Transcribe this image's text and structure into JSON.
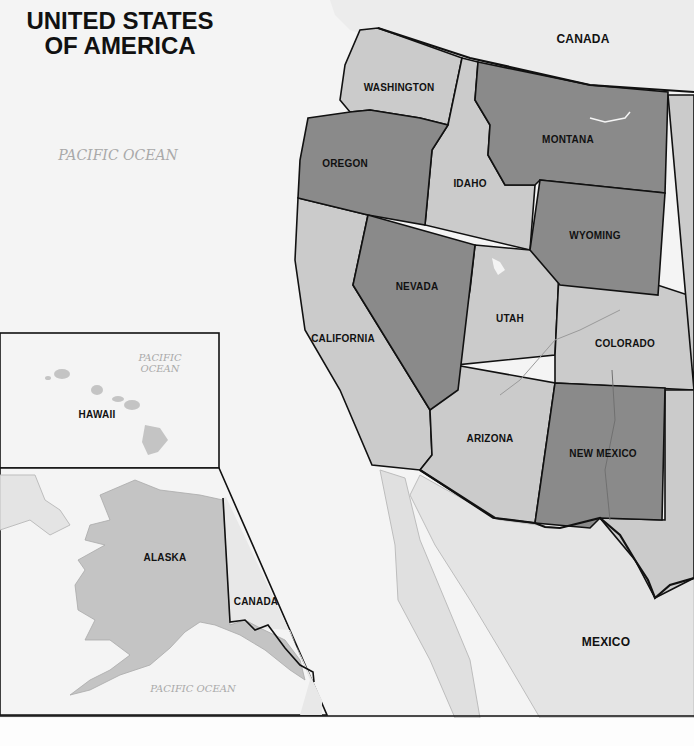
{
  "map": {
    "title_line1": "UNITED STATES",
    "title_line2": "OF AMERICA",
    "oceans": {
      "main": "PACIFIC OCEAN",
      "hawaii_line1": "PACIFIC",
      "hawaii_line2": "OCEAN",
      "alaska": "PACIFIC OCEAN"
    },
    "countries": {
      "canada_north": "CANADA",
      "canada_inset": "CANADA",
      "mexico": "MEXICO"
    },
    "states": {
      "washington": "WASHINGTON",
      "oregon": "OREGON",
      "idaho": "IDAHO",
      "montana": "MONTANA",
      "wyoming": "WYOMING",
      "nevada": "NEVADA",
      "utah": "UTAH",
      "colorado": "COLORADO",
      "california": "CALIFORNIA",
      "arizona": "ARIZONA",
      "new_mexico": "NEW MEXICO",
      "hawaii": "HAWAII",
      "alaska": "ALASKA"
    },
    "colors": {
      "background": "#f4f4f4",
      "light_state": "#cbcbcb",
      "dark_state": "#8a8a8a",
      "foreign_land": "#e6e6e6",
      "border": "#111111",
      "ocean_text": "#a9a9a9"
    }
  }
}
